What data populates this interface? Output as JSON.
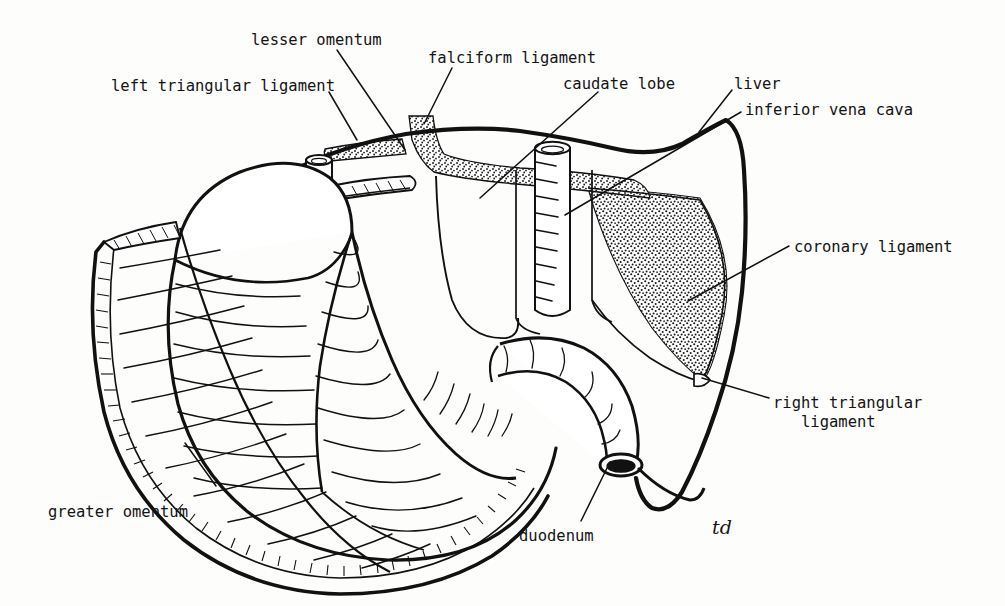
{
  "figure": {
    "background_color": "#fdfdfc",
    "ink_color": "#111111",
    "signature": "td"
  },
  "labels": [
    {
      "id": "lesser-omentum",
      "text": "lesser omentum",
      "x": 251,
      "y": 31,
      "align": "left"
    },
    {
      "id": "left-triangular-ligament",
      "text": "left triangular ligament",
      "x": 111,
      "y": 77,
      "align": "left"
    },
    {
      "id": "falciform-ligament",
      "text": "falciform ligament",
      "x": 428,
      "y": 49,
      "align": "left"
    },
    {
      "id": "caudate-lobe",
      "text": "caudate lobe",
      "x": 563,
      "y": 75,
      "align": "left"
    },
    {
      "id": "liver",
      "text": "liver",
      "x": 734,
      "y": 75,
      "align": "left"
    },
    {
      "id": "inferior-vena-cava",
      "text": "inferior vena cava",
      "x": 745,
      "y": 101,
      "align": "left"
    },
    {
      "id": "coronary-ligament",
      "text": "coronary ligament",
      "x": 794,
      "y": 238,
      "align": "left"
    },
    {
      "id": "right-triangular-ligament",
      "text": "right triangular\n   ligament",
      "x": 773,
      "y": 394,
      "align": "left"
    },
    {
      "id": "greater-omentum",
      "text": "greater omentum",
      "x": 48,
      "y": 503,
      "align": "left"
    },
    {
      "id": "duodenum",
      "text": "duodenum",
      "x": 519,
      "y": 527,
      "align": "left"
    }
  ],
  "leader_lines": [
    {
      "id": "leader-lesser-omentum",
      "points": "337,50 405,148"
    },
    {
      "id": "leader-left-triangular-ligament",
      "points": "328,93 356,137"
    },
    {
      "id": "leader-falciform-ligament",
      "points": "451,68 423,127"
    },
    {
      "id": "leader-caudate-lobe",
      "points": "597,93 481,196"
    },
    {
      "id": "leader-liver",
      "points": "731,91 700,131"
    },
    {
      "id": "leader-inferior-vena-cava",
      "points": "740,112 566,214"
    },
    {
      "id": "leader-coronary-ligament",
      "points": "788,247 690,300"
    },
    {
      "id": "leader-right-triangular-ligament",
      "points": "768,398 703,379"
    },
    {
      "id": "leader-greater-omentum",
      "points": "215,485 184,444"
    },
    {
      "id": "leader-duodenum",
      "points": "580,520 609,463"
    }
  ],
  "structures": [
    {
      "id": "liver",
      "name": "liver",
      "fill": "none"
    },
    {
      "id": "stomach",
      "name": "stomach",
      "fill": "none"
    },
    {
      "id": "greater-omentum",
      "name": "greater omentum",
      "fill": "none"
    },
    {
      "id": "duodenum",
      "name": "duodenum",
      "fill": "none"
    },
    {
      "id": "inferior-vena-cava",
      "name": "inferior vena cava",
      "fill": "none"
    },
    {
      "id": "oesophagus-stump",
      "name": "oesophagus stump",
      "fill": "none"
    },
    {
      "id": "falciform-ligament",
      "name": "falciform ligament",
      "fill": "stipple"
    },
    {
      "id": "coronary-ligament",
      "name": "coronary ligament",
      "fill": "stipple"
    },
    {
      "id": "left-triangular-ligament",
      "name": "left triangular ligament",
      "fill": "stipple"
    },
    {
      "id": "lesser-omentum",
      "name": "lesser omentum",
      "fill": "none"
    },
    {
      "id": "caudate-lobe",
      "name": "caudate lobe",
      "fill": "none"
    }
  ]
}
